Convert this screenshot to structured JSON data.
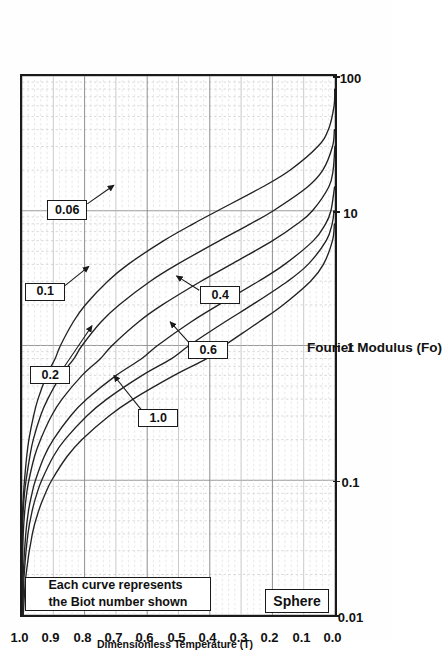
{
  "figure": {
    "kind": "transient-conduction-chart",
    "sphere_label": "Sphere",
    "note_line1": "Each curve represents",
    "note_line2": "the Biot number shown"
  },
  "axes": {
    "x_title": "Fourier Modulus (Fo)",
    "y_title": "Dimensionless Temperature (T)",
    "x_ticks": [
      "0.01",
      "0.1",
      "1",
      "10",
      "100"
    ],
    "y_ticks": [
      "1.0",
      "0.9",
      "0.8",
      "0.7",
      "0.6",
      "0.5",
      "0.4",
      "0.3",
      "0.2",
      "0.1",
      "0.0"
    ]
  },
  "curve_labels": [
    {
      "text": "1.0"
    },
    {
      "text": "0.6"
    },
    {
      "text": "0.4"
    },
    {
      "text": "0.2"
    },
    {
      "text": "0.1"
    },
    {
      "text": "0.06"
    }
  ],
  "chart_data": {
    "type": "line",
    "title": "Sphere",
    "xlabel": "Fourier Modulus (Fo)",
    "ylabel": "Dimensionless Temperature (T)",
    "xscale": "log",
    "yscale": "linear",
    "xlim": [
      0.01,
      100
    ],
    "ylim": [
      0.0,
      1.0
    ],
    "grid": true,
    "legend": "inline curve labels (Biot number)",
    "annotations": [
      "Each curve represents the Biot number shown",
      "Sphere"
    ],
    "x": [
      0.01,
      0.02,
      0.04,
      0.06,
      0.08,
      0.1,
      0.15,
      0.2,
      0.3,
      0.4,
      0.6,
      0.8,
      1,
      1.5,
      2,
      3,
      4,
      6,
      8,
      10,
      15,
      20,
      30,
      40,
      60,
      80,
      100
    ],
    "series": [
      {
        "name": "Bi = 0.06",
        "biot": 0.06,
        "values": [
          1.0,
          1.0,
          1.0,
          0.998,
          0.995,
          0.992,
          0.985,
          0.978,
          0.963,
          0.949,
          0.921,
          0.894,
          0.877,
          0.836,
          0.798,
          0.726,
          0.661,
          0.547,
          0.453,
          0.375,
          0.232,
          0.144,
          0.055,
          0.021,
          0.003,
          0.001,
          0.0
        ]
      },
      {
        "name": "Bi = 0.1",
        "biot": 0.1,
        "values": [
          1.0,
          1.0,
          0.999,
          0.996,
          0.992,
          0.987,
          0.975,
          0.964,
          0.941,
          0.918,
          0.875,
          0.834,
          0.808,
          0.747,
          0.69,
          0.59,
          0.504,
          0.369,
          0.27,
          0.197,
          0.088,
          0.039,
          0.008,
          0.002,
          0.0,
          0.0,
          0.0
        ]
      },
      {
        "name": "Bi = 0.2",
        "biot": 0.2,
        "values": [
          1.0,
          0.999,
          0.996,
          0.991,
          0.985,
          0.978,
          0.96,
          0.941,
          0.906,
          0.872,
          0.808,
          0.749,
          0.712,
          0.627,
          0.552,
          0.428,
          0.332,
          0.199,
          0.12,
          0.072,
          0.02,
          0.006,
          0.0005,
          0.0,
          0.0,
          0.0,
          0.0
        ]
      },
      {
        "name": "Bi = 0.4",
        "biot": 0.4,
        "values": [
          0.999,
          0.996,
          0.988,
          0.979,
          0.968,
          0.957,
          0.929,
          0.9,
          0.845,
          0.793,
          0.699,
          0.617,
          0.567,
          0.459,
          0.372,
          0.244,
          0.161,
          0.069,
          0.03,
          0.013,
          0.0015,
          0.0002,
          0.0,
          0.0,
          0.0,
          0.0,
          0.0
        ]
      },
      {
        "name": "Bi = 0.6",
        "biot": 0.6,
        "values": [
          0.998,
          0.993,
          0.981,
          0.967,
          0.952,
          0.937,
          0.9,
          0.863,
          0.793,
          0.729,
          0.616,
          0.522,
          0.466,
          0.351,
          0.265,
          0.151,
          0.086,
          0.028,
          0.009,
          0.003,
          0.0,
          0.0,
          0.0,
          0.0,
          0.0,
          0.0,
          0.0
        ]
      },
      {
        "name": "Bi = 1.0",
        "biot": 1.0,
        "values": [
          0.996,
          0.987,
          0.967,
          0.946,
          0.925,
          0.905,
          0.856,
          0.809,
          0.722,
          0.645,
          0.514,
          0.41,
          0.353,
          0.242,
          0.166,
          0.078,
          0.037,
          0.008,
          0.002,
          0.0004,
          0.0,
          0.0,
          0.0,
          0.0,
          0.0,
          0.0,
          0.0
        ]
      }
    ]
  }
}
